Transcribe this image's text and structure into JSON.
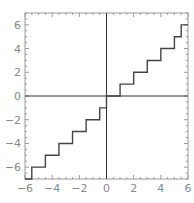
{
  "chart_data": {
    "type": "line",
    "title": "",
    "xlabel": "",
    "ylabel": "",
    "xlim": [
      -6,
      6
    ],
    "ylim": [
      -7,
      7
    ],
    "grid": false,
    "legend": null,
    "series": [
      {
        "name": "floor(x)",
        "step": true,
        "segments": [
          {
            "x0": -6,
            "x1": -5.5,
            "y": -7
          },
          {
            "x0": -5.5,
            "x1": -4.5,
            "y": -6
          },
          {
            "x0": -4.5,
            "x1": -3.5,
            "y": -5
          },
          {
            "x0": -3.5,
            "x1": -2.5,
            "y": -4
          },
          {
            "x0": -2.5,
            "x1": -1.5,
            "y": -3
          },
          {
            "x0": -1.5,
            "x1": -0.5,
            "y": -2
          },
          {
            "x0": -0.5,
            "x1": 0,
            "y": -1
          },
          {
            "x0": 0,
            "x1": 1,
            "y": 0
          },
          {
            "x0": 1,
            "x1": 2,
            "y": 1
          },
          {
            "x0": 2,
            "x1": 3,
            "y": 2
          },
          {
            "x0": 3,
            "x1": 4,
            "y": 3
          },
          {
            "x0": 4,
            "x1": 5,
            "y": 4
          },
          {
            "x0": 5,
            "x1": 5.5,
            "y": 5
          },
          {
            "x0": 5.5,
            "x1": 6,
            "y": 6
          }
        ]
      }
    ],
    "xticks": [
      -6,
      -4,
      -2,
      0,
      2,
      4,
      6
    ],
    "xtick_labels": [
      "-6",
      "-4",
      "-2",
      "0",
      "2",
      "4",
      "6"
    ],
    "yticks": [
      -6,
      -4,
      -2,
      0,
      2,
      4,
      6
    ],
    "ytick_labels": [
      "-6",
      "-4",
      "-2",
      "0",
      "2",
      "4",
      "6"
    ],
    "colors": {
      "line": "#444444",
      "axes": "#333333",
      "frame": "#999999",
      "tick_label": "#888888"
    }
  }
}
